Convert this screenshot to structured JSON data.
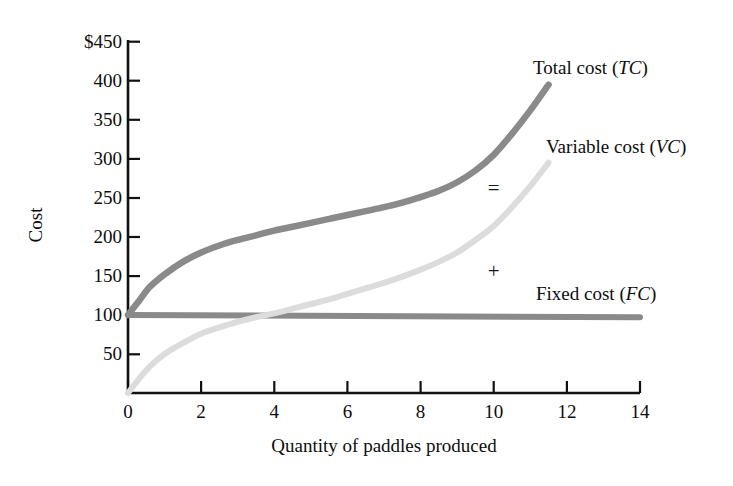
{
  "chart_data": {
    "type": "line",
    "title": "",
    "xlabel": "Quantity of paddles produced",
    "ylabel": "Cost",
    "xlim": [
      0,
      14
    ],
    "ylim": [
      0,
      450
    ],
    "grid": false,
    "legend_position": "inline-right",
    "x_ticks": [
      "0",
      "2",
      "4",
      "6",
      "8",
      "10",
      "12",
      "14"
    ],
    "x_tick_values": [
      0,
      2,
      4,
      6,
      8,
      10,
      12,
      14
    ],
    "y_ticks": [
      "50",
      "100",
      "150",
      "200",
      "250",
      "300",
      "350",
      "400",
      "$450"
    ],
    "y_tick_values": [
      50,
      100,
      150,
      200,
      250,
      300,
      350,
      400,
      450
    ],
    "y_axis_currency_prefix": "$",
    "series": [
      {
        "name": "Total cost (TC)",
        "abbr": "TC",
        "label_text": "Total cost (",
        "label_close": ")",
        "color": "#8a8a8a",
        "x": [
          0,
          0.3,
          0.6,
          1.0,
          1.5,
          2.0,
          2.5,
          3.0,
          3.5,
          4.0,
          4.5,
          5.0,
          5.5,
          6.0,
          6.5,
          7.0,
          7.5,
          8.0,
          8.5,
          9.0,
          9.5,
          10.0,
          10.5,
          11.0,
          11.5
        ],
        "y": [
          100,
          118,
          136,
          152,
          168,
          180,
          189,
          196,
          202,
          208,
          213,
          218,
          223,
          228,
          233,
          238,
          244,
          251,
          259,
          270,
          285,
          305,
          332,
          362,
          395
        ]
      },
      {
        "name": "Variable cost (VC)",
        "abbr": "VC",
        "label_text": "Variable cost (",
        "label_close": ")",
        "color": "#dcdcdc",
        "x": [
          0,
          0.3,
          0.6,
          1.0,
          1.5,
          2.0,
          2.5,
          3.0,
          3.5,
          4.0,
          4.5,
          5.0,
          5.5,
          6.0,
          6.5,
          7.0,
          7.5,
          8.0,
          8.5,
          9.0,
          9.5,
          10.0,
          10.5,
          11.0,
          11.5
        ],
        "y": [
          0,
          18,
          34,
          50,
          64,
          76,
          84,
          91,
          97,
          102,
          108,
          114,
          120,
          127,
          134,
          141,
          149,
          158,
          168,
          180,
          196,
          214,
          238,
          265,
          295
        ]
      },
      {
        "name": "Fixed cost (FC)",
        "abbr": "FC",
        "label_text": "Fixed cost (",
        "label_close": ")",
        "color": "#8a8a8a",
        "x": [
          0,
          14
        ],
        "y": [
          100,
          97
        ]
      }
    ],
    "annotations": [
      {
        "name": "equals-symbol",
        "text": "=",
        "x": 10.0,
        "y": 253
      },
      {
        "name": "plus-symbol",
        "text": "+",
        "x": 10.0,
        "y": 147
      }
    ]
  }
}
